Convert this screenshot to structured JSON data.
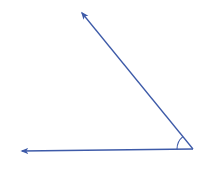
{
  "diagram": {
    "type": "angle",
    "colors": {
      "background": "#ffffff",
      "ray": "#3d5aa8",
      "arc": "#3d5aa8"
    },
    "vertex": {
      "x": 193,
      "y": 149
    },
    "rays": [
      {
        "name": "horizontal-ray",
        "from": {
          "x": 193,
          "y": 149
        },
        "to": {
          "x": 22,
          "y": 151
        }
      },
      {
        "name": "diagonal-ray",
        "from": {
          "x": 193,
          "y": 149
        },
        "to": {
          "x": 82,
          "y": 13
        }
      }
    ],
    "angle_marker": {
      "radius": 16
    }
  }
}
